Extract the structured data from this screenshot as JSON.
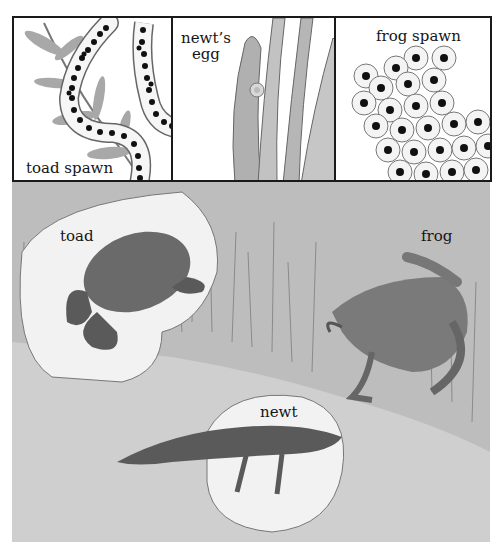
{
  "panels": [
    {
      "id": "toad-spawn",
      "label": "toad spawn"
    },
    {
      "id": "newt-egg",
      "label_line1": "newt’s",
      "label_line2": "egg"
    },
    {
      "id": "frog-spawn",
      "label": "frog spawn"
    }
  ],
  "scene": {
    "animals": [
      {
        "id": "toad",
        "label": "toad"
      },
      {
        "id": "frog",
        "label": "frog"
      },
      {
        "id": "newt",
        "label": "newt"
      }
    ]
  },
  "colors": {
    "border": "#1a1a1a",
    "background": "#ffffff",
    "ground": "#cfcfcf",
    "rock": "#f4f4f4",
    "leaf": "#a8a8a8",
    "egg_dark": "#111111"
  }
}
